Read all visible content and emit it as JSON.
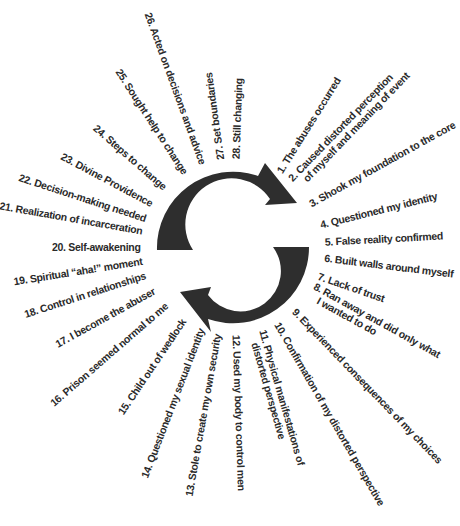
{
  "diagram": {
    "center": [
      233,
      247
    ],
    "ring": {
      "outer_radius": 76,
      "inner_radius": 40,
      "color": "#2e2e2e"
    },
    "steps": [
      {
        "n": 1,
        "text": "1. The abuses occurred",
        "angle": -58,
        "r": 88
      },
      {
        "n": 2,
        "text": "2. Caused distorted perception\nof myself and meaning of event",
        "angle": -46,
        "r": 88
      },
      {
        "n": 3,
        "text": "3. Shook my foundation to the core",
        "angle": -29,
        "r": 88
      },
      {
        "n": 4,
        "text": "4. Questioned my identity",
        "angle": -14,
        "r": 90
      },
      {
        "n": 5,
        "text": "5. False reality confirmed",
        "angle": -3,
        "r": 92
      },
      {
        "n": 6,
        "text": "6. Built walls around myself",
        "angle": 7,
        "r": 92
      },
      {
        "n": 7,
        "text": "7. Lack of trust",
        "angle": 19,
        "r": 90
      },
      {
        "n": 8,
        "text": "8. Ran away and did only what\nI wanted to do",
        "angle": 29,
        "r": 90
      },
      {
        "n": 9,
        "text": "9. Experienced consequences of my choices",
        "angle": 46,
        "r": 88
      },
      {
        "n": 10,
        "text": "10. Confirmation of my distorted perspective",
        "angle": 60,
        "r": 88
      },
      {
        "n": 11,
        "text": "11. Physical manifestations of\ndistorted perspective",
        "angle": 74,
        "r": 88
      },
      {
        "n": 12,
        "text": "12. Used my body to control men",
        "angle": 88,
        "r": 88
      },
      {
        "n": 13,
        "text": "13. Stole to create my own security",
        "angle": 100,
        "r": 88
      },
      {
        "n": 14,
        "text": "14. Questioned my sexual identity",
        "angle": 111,
        "r": 88
      },
      {
        "n": 15,
        "text": "15. Child out of wedlock",
        "angle": 124,
        "r": 88
      },
      {
        "n": 16,
        "text": "16. Prison seemed normal to me",
        "angle": 139,
        "r": 88
      },
      {
        "n": 17,
        "text": "17. I become the abuser",
        "angle": 151,
        "r": 90
      },
      {
        "n": 18,
        "text": "18. Control in relationships",
        "angle": 162,
        "r": 92
      },
      {
        "n": 19,
        "text": "19. Spiritual “aha!” moment",
        "angle": 171,
        "r": 92
      },
      {
        "n": 20,
        "text": "20. Self-awakening",
        "angle": 180,
        "r": 92
      },
      {
        "n": 21,
        "text": "21. Realization of incarceration",
        "angle": 190,
        "r": 92
      },
      {
        "n": 22,
        "text": "22. Decision-making needed",
        "angle": 198,
        "r": 92
      },
      {
        "n": 23,
        "text": "23. Divine Providence",
        "angle": 208,
        "r": 92
      },
      {
        "n": 24,
        "text": "24. Steps to change",
        "angle": 221,
        "r": 90
      },
      {
        "n": 25,
        "text": "25. Sought help to change",
        "angle": 237,
        "r": 88
      },
      {
        "n": 26,
        "text": "26. Acted on decisions and advice",
        "angle": 250,
        "r": 88
      },
      {
        "n": 27,
        "text": "27. Set boundaries",
        "angle": 262,
        "r": 88
      },
      {
        "n": 28,
        "text": "28. Still changing",
        "angle": 272,
        "r": 88
      }
    ]
  }
}
